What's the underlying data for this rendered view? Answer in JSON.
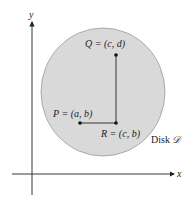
{
  "diagram": {
    "axes": {
      "x_label": "x",
      "y_label": "y"
    },
    "disk": {
      "label_prefix": "Disk ",
      "label_symbol": "𝒟",
      "fill": "#d9d9d9",
      "stroke": "#9a9a9a"
    },
    "points": {
      "P": {
        "label": "P = (a, b)"
      },
      "Q": {
        "label": "Q = (c, d)"
      },
      "R": {
        "label": "R = (c, b)"
      }
    }
  }
}
